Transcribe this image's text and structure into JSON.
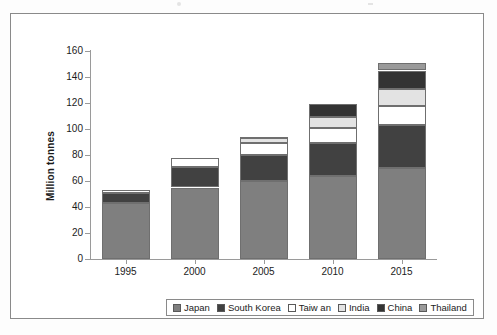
{
  "chart_data": {
    "type": "bar",
    "stacked": true,
    "title": "",
    "xlabel": "",
    "ylabel": "Million tonnes",
    "ylim": [
      0,
      160
    ],
    "ytick_step": 20,
    "yticks": [
      0,
      20,
      40,
      60,
      80,
      100,
      120,
      140,
      160
    ],
    "ytick_labels": [
      "0",
      "20",
      "40",
      "60",
      "80",
      "100",
      "120",
      "140",
      "160"
    ],
    "categories": [
      "1995",
      "2000",
      "2005",
      "2010",
      "2015"
    ],
    "grid": false,
    "legend_position": "bottom",
    "series": [
      {
        "name": "Japan",
        "color": "#7f7f7f",
        "values": [
          43,
          55,
          60,
          64,
          70
        ]
      },
      {
        "name": "South Korea",
        "color": "#414141",
        "values": [
          8,
          16,
          20,
          25,
          33
        ]
      },
      {
        "name": "Taiw an",
        "color": "#ffffff",
        "values": [
          2,
          7,
          9,
          12,
          15
        ]
      },
      {
        "name": "India",
        "color": "#e3e3e3",
        "values": [
          0,
          0,
          4,
          8,
          13
        ]
      },
      {
        "name": "China",
        "color": "#333333",
        "values": [
          0,
          0,
          1,
          10,
          14
        ]
      },
      {
        "name": "Thailand",
        "color": "#9a9a9a",
        "values": [
          0,
          0,
          0,
          0,
          6
        ]
      }
    ],
    "totals": [
      53,
      78,
      94,
      119,
      151
    ]
  },
  "legend": {
    "items": [
      {
        "label": "Japan",
        "color": "#7f7f7f"
      },
      {
        "label": "South Korea",
        "color": "#414141"
      },
      {
        "label": "Taiw an",
        "color": "#ffffff"
      },
      {
        "label": "India",
        "color": "#e3e3e3"
      },
      {
        "label": "China",
        "color": "#333333"
      },
      {
        "label": "Thailand",
        "color": "#9a9a9a"
      }
    ]
  },
  "axes": {
    "y_title": "Million tonnes"
  }
}
